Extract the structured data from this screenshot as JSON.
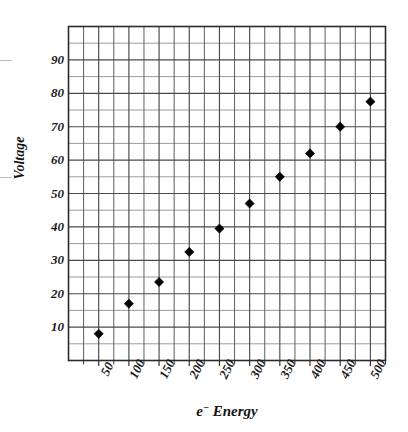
{
  "chart_data": {
    "type": "scatter",
    "title": "",
    "xlabel": "e⁻ Energy",
    "ylabel": "Voltage",
    "xlim": [
      0,
      525
    ],
    "ylim": [
      0,
      100
    ],
    "grid": true,
    "legend": false,
    "x_major_step": 50,
    "x_minor_step": 25,
    "y_major_step": 10,
    "y_minor_step": 5,
    "x_ticklabels": [
      "50",
      "100",
      "150",
      "200",
      "250",
      "300",
      "350",
      "400",
      "450",
      "500"
    ],
    "x_tickvalues": [
      50,
      100,
      150,
      200,
      250,
      300,
      350,
      400,
      450,
      500
    ],
    "y_ticklabels": [
      "10",
      "20",
      "30",
      "40",
      "50",
      "60",
      "70",
      "80",
      "90"
    ],
    "y_tickvalues": [
      10,
      20,
      30,
      40,
      50,
      60,
      70,
      80,
      90
    ],
    "marker": "diamond",
    "marker_color": "#000000",
    "line_color": "#000000",
    "series": [
      {
        "name": "Voltage vs e⁻ Energy",
        "x": [
          50,
          100,
          150,
          200,
          250,
          300,
          350,
          400,
          450,
          500
        ],
        "values": [
          8,
          17,
          23.5,
          32.5,
          39.5,
          47,
          55,
          62,
          70,
          77.5
        ]
      }
    ],
    "trendline": {
      "type": "linear",
      "x_start": 42,
      "y_start": 5.5,
      "x_end": 510,
      "y_end": 81
    }
  },
  "axis_titles": {
    "y": "Voltage",
    "x_prefix": "e",
    "x_superscript": "−",
    "x_suffix": " Energy"
  },
  "colors": {
    "background": "#ffffff",
    "plot_border": "#2b2b2b",
    "major_grid": "#4a4a4a",
    "minor_grid_vertical": "#555555",
    "minor_grid_horizontal": "#8a8a8a",
    "data": "#000000",
    "text": "#1a1a1a"
  }
}
